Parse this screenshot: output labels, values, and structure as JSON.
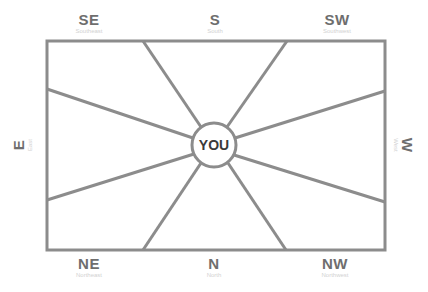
{
  "diagram": {
    "type": "directional-orientation",
    "colors": {
      "line": "#8c8c8c",
      "label": "#6e6e6e",
      "subtitle": "#d2d2d2",
      "center_text": "#3a3a3a",
      "background": "#ffffff"
    },
    "center": {
      "label": "YOU"
    },
    "directions": {
      "top_left": {
        "abbr": "SE",
        "full": "Southeast"
      },
      "top_center": {
        "abbr": "S",
        "full": "South"
      },
      "top_right": {
        "abbr": "SW",
        "full": "Southwest"
      },
      "left": {
        "abbr": "E",
        "full": "East"
      },
      "right": {
        "abbr": "W",
        "full": "West"
      },
      "bottom_left": {
        "abbr": "NE",
        "full": "Northeast"
      },
      "bottom_center": {
        "abbr": "N",
        "full": "North"
      },
      "bottom_right": {
        "abbr": "NW",
        "full": "Northwest"
      }
    }
  }
}
